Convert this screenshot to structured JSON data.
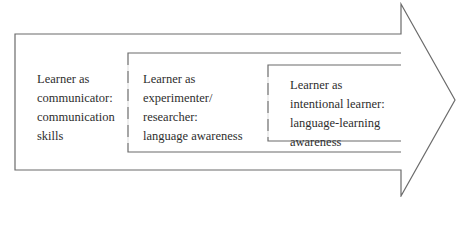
{
  "diagram": {
    "type": "nested-arrow",
    "stroke_color": "#6b6b6b",
    "stages": [
      {
        "name": "communicator",
        "lines": [
          "Learner as",
          "communicator:",
          "communication",
          "skills"
        ]
      },
      {
        "name": "experimenter-researcher",
        "lines": [
          "Learner as",
          "experimenter/",
          "researcher:",
          "language awareness"
        ]
      },
      {
        "name": "intentional-learner",
        "lines": [
          "Learner as",
          "intentional learner:",
          "language-learning",
          "awareness"
        ]
      }
    ]
  }
}
